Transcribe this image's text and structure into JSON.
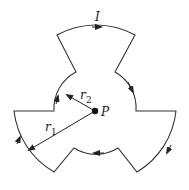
{
  "diagram": {
    "labels": {
      "current": "I",
      "point": "P",
      "r1_main": "r",
      "r1_sub": "1",
      "r2_main": "r",
      "r2_sub": "2"
    },
    "geometry": {
      "center": [
        95,
        111
      ],
      "outer_radius": 81,
      "inner_radius": 41,
      "arc_span_deg": 60,
      "arc_count_each": 3
    },
    "colors": {
      "stroke": "#333333",
      "background": "#ffffff"
    }
  }
}
